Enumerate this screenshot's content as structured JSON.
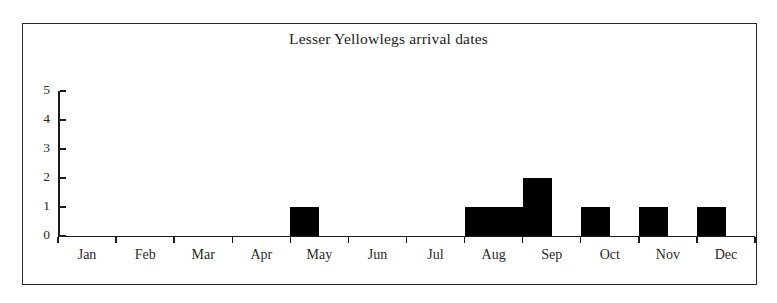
{
  "chart_data": {
    "type": "bar",
    "title": "Lesser Yellowlegs arrival dates",
    "xlabel": "",
    "ylabel": "",
    "ylim": [
      0,
      5
    ],
    "yticks": [
      0,
      1,
      2,
      3,
      4,
      5
    ],
    "grid": false,
    "legend": null,
    "categories": [
      "Jan",
      "Feb",
      "Mar",
      "Apr",
      "May",
      "Jun",
      "Jul",
      "Aug",
      "Sep",
      "Oct",
      "Nov",
      "Dec"
    ],
    "monthly_totals": [
      0,
      0,
      0,
      0,
      1,
      0,
      0,
      4,
      1,
      2,
      0,
      0
    ],
    "bin_width_months": 0.5,
    "bins": [
      {
        "label": "Jan early",
        "start_month": 1.0,
        "value": 0
      },
      {
        "label": "Jan late",
        "start_month": 1.5,
        "value": 0
      },
      {
        "label": "Feb early",
        "start_month": 2.0,
        "value": 0
      },
      {
        "label": "Feb late",
        "start_month": 2.5,
        "value": 0
      },
      {
        "label": "Mar early",
        "start_month": 3.0,
        "value": 0
      },
      {
        "label": "Mar late",
        "start_month": 3.5,
        "value": 0
      },
      {
        "label": "Apr early",
        "start_month": 4.0,
        "value": 0
      },
      {
        "label": "Apr late",
        "start_month": 4.5,
        "value": 0
      },
      {
        "label": "May early",
        "start_month": 5.0,
        "value": 1
      },
      {
        "label": "May late",
        "start_month": 5.5,
        "value": 0
      },
      {
        "label": "Jun early",
        "start_month": 6.0,
        "value": 0
      },
      {
        "label": "Jun late",
        "start_month": 6.5,
        "value": 0
      },
      {
        "label": "Jul early",
        "start_month": 7.0,
        "value": 0
      },
      {
        "label": "Jul late",
        "start_month": 7.5,
        "value": 0
      },
      {
        "label": "Aug early",
        "start_month": 8.0,
        "value": 1
      },
      {
        "label": "Aug mid",
        "start_month": 8.5,
        "value": 1
      },
      {
        "label": "Aug late",
        "start_month": 9.0,
        "value": 2
      },
      {
        "label": "Sep early",
        "start_month": 9.5,
        "value": 0
      },
      {
        "label": "Sep mid",
        "start_month": 10.0,
        "value": 1
      },
      {
        "label": "Sep late",
        "start_month": 10.5,
        "value": 0
      },
      {
        "label": "Oct early",
        "start_month": 11.0,
        "value": 1
      },
      {
        "label": "Oct mid",
        "start_month": 11.5,
        "value": 0
      },
      {
        "label": "Oct late",
        "start_month": 12.0,
        "value": 1
      },
      {
        "label": "Nov early",
        "start_month": 12.5,
        "value": 0
      },
      {
        "label": "Nov late",
        "start_month": 13.0,
        "value": 0
      },
      {
        "label": "Dec early",
        "start_month": 13.5,
        "value": 0
      },
      {
        "label": "Dec late",
        "start_month": 14.0,
        "value": 0
      }
    ],
    "colors": {
      "bar": "#000000",
      "axis": "#1c1c1c",
      "frame": "#262626",
      "background": "#ffffff",
      "text": "#2a2a2a"
    }
  }
}
